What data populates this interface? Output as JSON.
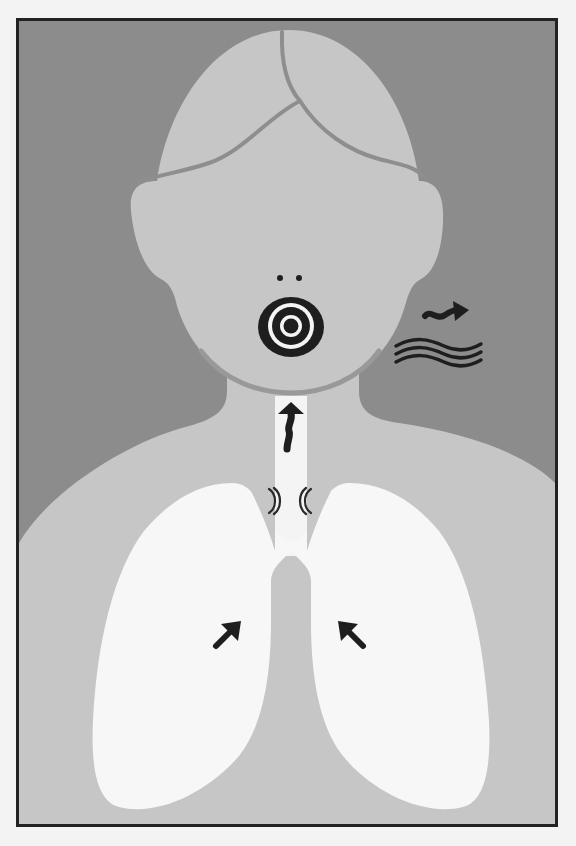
{
  "figure": {
    "title": "Voice production: airflow from lungs through larynx to mouth",
    "colors": {
      "frame_border": "#222222",
      "background": "#8c8c8c",
      "skin": "#c6c6c6",
      "hair_line": "#8e8e8e",
      "chin_line": "#999999",
      "lungs": "#f7f7f7",
      "trachea": "#f4f4f4",
      "mediastinum": "#c4c4c4",
      "ink": "#1e1e1e",
      "page": "#f3f3f3"
    },
    "elements": {
      "head": "head-with-parted-hair",
      "nostrils": "two-nostril-dots",
      "mouth": "concentric-rings-mouth",
      "sound_arrow": "squiggly-arrow-right",
      "sound_waves": "three-wavy-lines",
      "airflow_arrow": "squiggly-arrow-up-trachea",
      "vocal_folds": "paired-double-arcs",
      "lungs": "left-and-right-lungs",
      "lung_arrows": [
        "arrow-up-right",
        "arrow-up-left"
      ]
    }
  }
}
